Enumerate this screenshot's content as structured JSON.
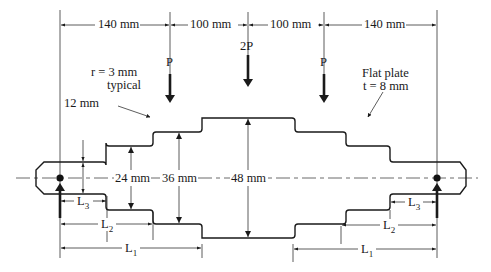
{
  "diagram": {
    "dimensions_top": [
      {
        "id": "d1",
        "label": "140 mm"
      },
      {
        "id": "d2",
        "label": "100 mm"
      },
      {
        "id": "d3",
        "label": "100 mm"
      },
      {
        "id": "d4",
        "label": "140 mm"
      }
    ],
    "loads": [
      {
        "id": "load-left",
        "label": "P"
      },
      {
        "id": "load-center",
        "label": "2P"
      },
      {
        "id": "load-right",
        "label": "P"
      }
    ],
    "annotations": {
      "fillet_radius_line1": "r = 3 mm",
      "fillet_radius_line2": "typical",
      "plate_line1": "Flat plate",
      "plate_line2": "t = 8 mm"
    },
    "widths": {
      "end_step": "12 mm",
      "w24": "24 mm",
      "w36": "36 mm",
      "w48": "48 mm"
    },
    "lengths_left": [
      {
        "id": "L3",
        "base": "L",
        "sub": "3"
      },
      {
        "id": "L2",
        "base": "L",
        "sub": "2"
      },
      {
        "id": "L1",
        "base": "L",
        "sub": "1"
      }
    ],
    "lengths_right": [
      {
        "id": "L3",
        "base": "L",
        "sub": "3"
      },
      {
        "id": "L2",
        "base": "L",
        "sub": "2"
      },
      {
        "id": "L1",
        "base": "L",
        "sub": "1"
      }
    ],
    "colors": {
      "line": "#1a1a1a",
      "background": "#ffffff"
    }
  }
}
